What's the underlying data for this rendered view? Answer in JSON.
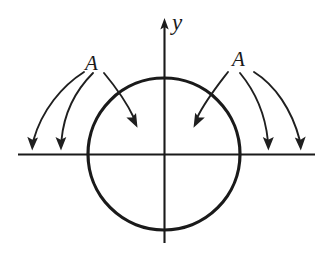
{
  "figure": {
    "background_color": "#ffffff",
    "ink_color": "#1a1a1a",
    "labels": {
      "y_axis": "y",
      "field_left": "A",
      "field_right": "A"
    },
    "geometry": {
      "origin": {
        "x": 164,
        "y": 154
      },
      "circle_radius": 76,
      "x_axis": {
        "x1": 18,
        "x2": 315,
        "y": 154
      },
      "y_axis": {
        "x": 164,
        "y_top": 22,
        "y_bottom": 243
      },
      "y_axis_arrow_tip": {
        "x": 164,
        "y": 20
      }
    },
    "arrows": [
      {
        "name": "outer-left-far",
        "group": "left",
        "start": {
          "x": 84,
          "y": 72
        },
        "end": {
          "x": 32,
          "y": 148
        },
        "direction": "down"
      },
      {
        "name": "outer-left-near",
        "group": "left",
        "start": {
          "x": 93,
          "y": 73
        },
        "end": {
          "x": 61,
          "y": 148
        },
        "direction": "down"
      },
      {
        "name": "inner-left",
        "group": "left",
        "start": {
          "x": 104,
          "y": 73
        },
        "end": {
          "x": 136,
          "y": 126
        },
        "direction": "down-right"
      },
      {
        "name": "inner-right",
        "group": "right",
        "start": {
          "x": 228,
          "y": 72
        },
        "end": {
          "x": 195,
          "y": 126
        },
        "direction": "down-left"
      },
      {
        "name": "outer-right-near",
        "group": "right",
        "start": {
          "x": 240,
          "y": 73
        },
        "end": {
          "x": 268,
          "y": 148
        },
        "direction": "down"
      },
      {
        "name": "outer-right-far",
        "group": "right",
        "start": {
          "x": 254,
          "y": 72
        },
        "end": {
          "x": 300,
          "y": 148
        },
        "direction": "down"
      }
    ]
  }
}
